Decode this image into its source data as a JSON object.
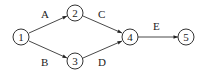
{
  "diagram": {
    "type": "activity-network",
    "nodes": [
      {
        "id": "1",
        "label": "1",
        "x": 21,
        "y": 37
      },
      {
        "id": "2",
        "label": "2",
        "x": 75,
        "y": 13
      },
      {
        "id": "3",
        "label": "3",
        "x": 75,
        "y": 61
      },
      {
        "id": "4",
        "label": "4",
        "x": 130,
        "y": 37
      },
      {
        "id": "5",
        "label": "5",
        "x": 186,
        "y": 37
      }
    ],
    "edges": [
      {
        "from": "1",
        "to": "2",
        "label": "A"
      },
      {
        "from": "1",
        "to": "3",
        "label": "B"
      },
      {
        "from": "2",
        "to": "4",
        "label": "C"
      },
      {
        "from": "3",
        "to": "4",
        "label": "D"
      },
      {
        "from": "4",
        "to": "5",
        "label": "E"
      }
    ]
  }
}
